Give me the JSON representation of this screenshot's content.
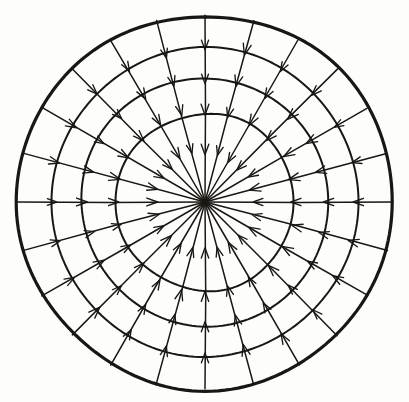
{
  "figure": {
    "title": "Radial Vector Field",
    "kind": "polar-grid-vector-field",
    "style": "hand-drawn ink on paper",
    "background_color": "#fdfdfb",
    "ink_color": "#1a1713"
  },
  "chart_data": {
    "type": "scatter",
    "title": "Radial Vector Field",
    "subtitle": "",
    "xlabel": "",
    "ylabel": "",
    "grid": true,
    "legend": false,
    "coordinate_system": "polar",
    "center": {
      "x": 205,
      "y": 202
    },
    "outer_radius": 188,
    "circle_count": 4,
    "circle_radii": [
      89,
      124,
      154,
      188
    ],
    "spoke_count": 24,
    "spoke_angle_step_deg": 15,
    "spoke_angles_deg": [
      0,
      15,
      30,
      45,
      60,
      75,
      90,
      105,
      120,
      135,
      150,
      165,
      180,
      195,
      210,
      225,
      240,
      255,
      270,
      285,
      300,
      315,
      330,
      345
    ],
    "arrow_direction": "inward",
    "arrow_semantics": "sink",
    "arrowheads_per_spoke": 4,
    "arrowhead_radii": [
      150,
      117,
      88,
      48
    ],
    "arrowhead_length": 11,
    "arrowhead_half_angle_deg": 20,
    "x": [
      0
    ],
    "values": [
      0
    ],
    "categories": [
      ""
    ],
    "xlim": [
      -188,
      188
    ],
    "ylim": [
      -188,
      188
    ]
  },
  "elements": {
    "outer_circle_label": "outer boundary circle",
    "inner_circles_label": "concentric grid circles",
    "spokes_label": "radial field lines",
    "arrowheads_label": "flow direction arrowheads",
    "center_label": "convergence point"
  }
}
